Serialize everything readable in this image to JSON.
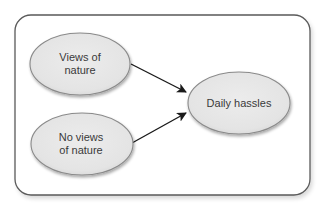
{
  "diagram": {
    "type": "path-diagram",
    "frame": {
      "x": 15,
      "y": 15,
      "width": 295,
      "height": 180,
      "radius": 16,
      "stroke": "#5a5a5a",
      "fill": "#ffffff"
    },
    "nodes": [
      {
        "id": "views-of-nature",
        "label_lines": [
          "Views of",
          "nature"
        ],
        "cx": 80,
        "cy": 64,
        "rx": 50,
        "ry": 31
      },
      {
        "id": "no-views-of-nature",
        "label_lines": [
          "No views",
          "of nature"
        ],
        "cx": 82,
        "cy": 144,
        "rx": 51,
        "ry": 31
      },
      {
        "id": "daily-hassles",
        "label_lines": [
          "Daily hassles"
        ],
        "cx": 239,
        "cy": 103,
        "rx": 51,
        "ry": 31
      }
    ],
    "edges": [
      {
        "from": "views-of-nature",
        "to": "daily-hassles",
        "x1": 131,
        "y1": 64,
        "x2": 186,
        "y2": 92
      },
      {
        "from": "no-views-of-nature",
        "to": "daily-hassles",
        "x1": 132,
        "y1": 143,
        "x2": 186,
        "y2": 113
      }
    ],
    "colors": {
      "node_fill": "#e6e6e6",
      "node_stroke": "#8a8a8a",
      "text": "#3a3a3a",
      "arrow": "#1a1a1a"
    }
  }
}
